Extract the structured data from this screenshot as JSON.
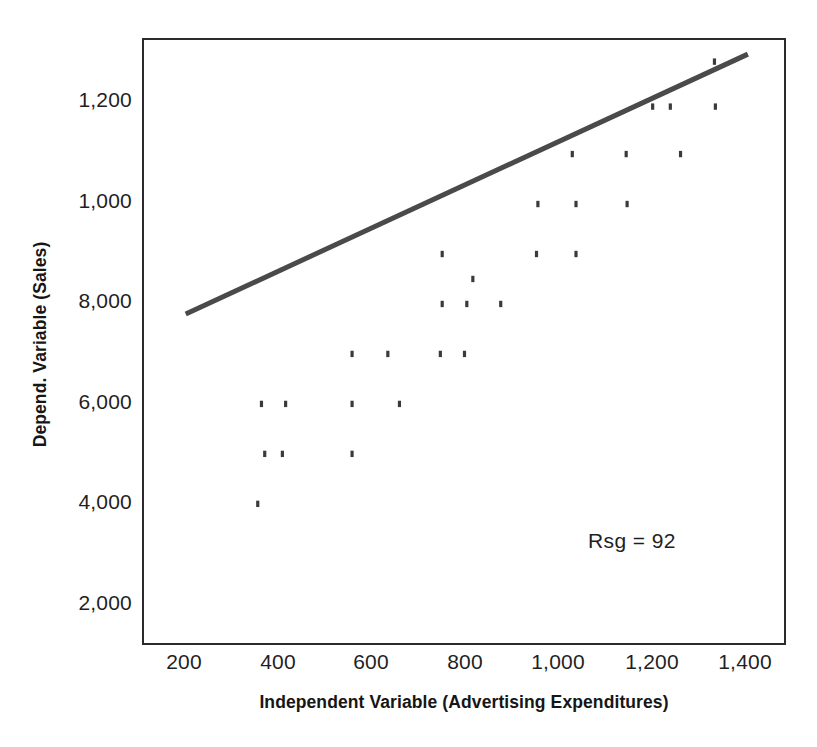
{
  "chart_data": {
    "type": "scatter",
    "title": "",
    "xlabel": "Independent Variable (Advertising Expenditures)",
    "ylabel": "Depend. Variable (Sales)",
    "xlim": [
      140,
      1440
    ],
    "ylim": [
      1600,
      1290
    ],
    "grid": false,
    "legend": null,
    "xticks": [
      200,
      400,
      600,
      800,
      1000,
      1200,
      1400
    ],
    "xticklabels": [
      "200",
      "400",
      "600",
      "800",
      "1,000",
      "1,200",
      "1,400"
    ],
    "yticks": [
      1200,
      1000,
      8000,
      6000,
      4000,
      2000
    ],
    "yticklabels": [
      "1,200",
      "1,000",
      "8,000",
      "6,000",
      "4,000",
      "2,000"
    ],
    "ytick_note": "Axis labels as printed top-to-bottom: 1,200 / 1,000 / 8,000 / 6,000 / 4,000 / 2,000 (evenly spaced)",
    "series": [
      {
        "name": "Observations",
        "marker": "dot",
        "color": "#3a3a3a",
        "points": [
          {
            "x": 355,
            "y": 3950
          },
          {
            "x": 370,
            "y": 4950
          },
          {
            "x": 408,
            "y": 4950
          },
          {
            "x": 558,
            "y": 4950
          },
          {
            "x": 363,
            "y": 5950
          },
          {
            "x": 415,
            "y": 5950
          },
          {
            "x": 558,
            "y": 5950
          },
          {
            "x": 660,
            "y": 5950
          },
          {
            "x": 558,
            "y": 6950
          },
          {
            "x": 635,
            "y": 6950
          },
          {
            "x": 748,
            "y": 6950
          },
          {
            "x": 800,
            "y": 6950
          },
          {
            "x": 752,
            "y": 7950
          },
          {
            "x": 805,
            "y": 7950
          },
          {
            "x": 878,
            "y": 7950
          },
          {
            "x": 818,
            "y": 8450
          },
          {
            "x": 752,
            "y": 8950
          },
          {
            "x": 955,
            "y": 8950
          },
          {
            "x": 1040,
            "y": 8950
          },
          {
            "x": 958,
            "y": 9950
          },
          {
            "x": 1040,
            "y": 9950
          },
          {
            "x": 1150,
            "y": 9950
          },
          {
            "x": 1032,
            "y": 10950
          },
          {
            "x": 1148,
            "y": 10950
          },
          {
            "x": 1265,
            "y": 10950
          },
          {
            "x": 1205,
            "y": 11900
          },
          {
            "x": 1243,
            "y": 11900
          },
          {
            "x": 1340,
            "y": 11900
          },
          {
            "x": 1338,
            "y": 12800
          }
        ]
      }
    ],
    "trendline": {
      "name": "Regression line",
      "color": "#4a4a4a",
      "width": 5,
      "start": {
        "x": 200,
        "y": 7750
      },
      "end": {
        "x": 1410,
        "y": 12950
      }
    },
    "annotations": [
      {
        "name": "r-squared-label",
        "text": "Rsg = 92",
        "x": 1200,
        "y": 3000
      }
    ]
  },
  "axis": {
    "x_title": "Independent Variable (Advertising Expenditures)",
    "y_title": "Depend. Variable (Sales)",
    "x_labels": [
      "200",
      "400",
      "600",
      "800",
      "1,000",
      "1,200",
      "1,400"
    ],
    "y_labels": [
      "1,200",
      "1,000",
      "8,000",
      "6,000",
      "4,000",
      "2,000"
    ]
  },
  "annotation": {
    "rsq_text": "Rsg = 92"
  },
  "colors": {
    "frame": "#2b2b2b",
    "marker": "#3a3a3a",
    "trendline": "#4a4a4a",
    "text": "#1f1f1f",
    "background": "#ffffff"
  }
}
